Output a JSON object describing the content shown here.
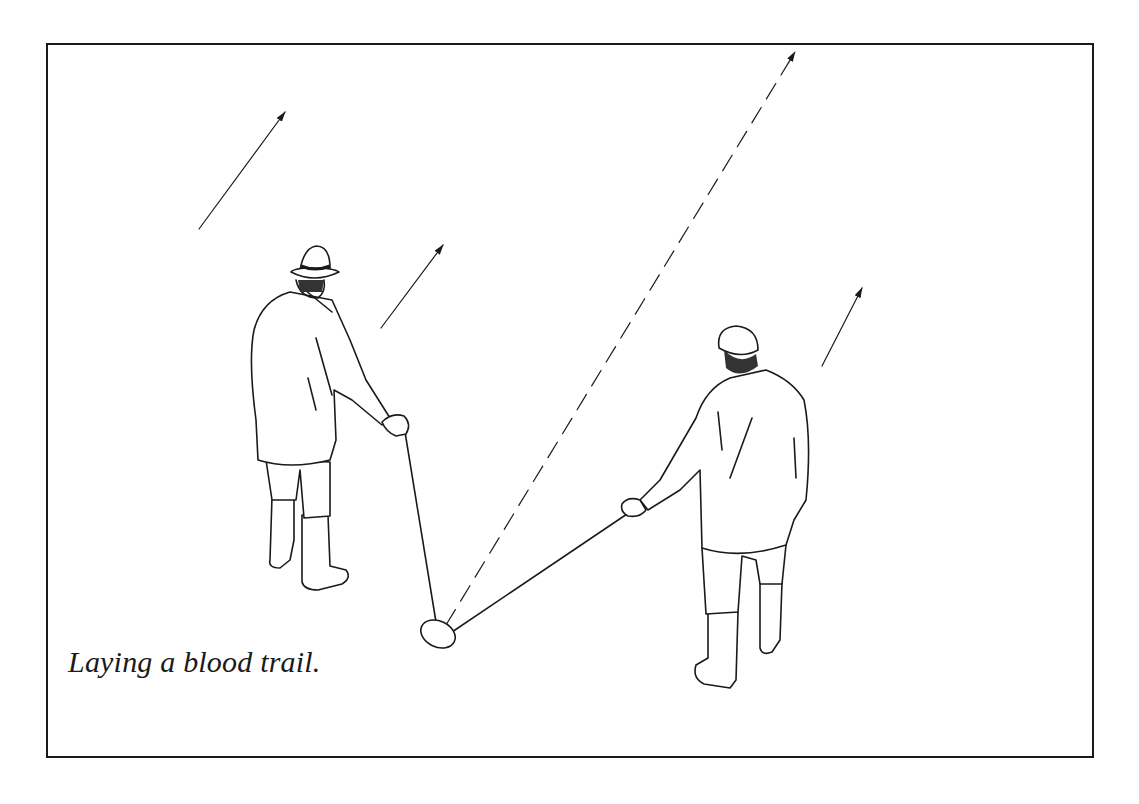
{
  "figure": {
    "caption": "Laying a blood trail.",
    "colors": {
      "ink": "#1a1a1a",
      "background": "#ffffff"
    },
    "elements": [
      "direction-arrow",
      "direction-arrow",
      "direction-arrow",
      "dashed-trail-line",
      "man-with-hat-holding-stick",
      "man-with-cap-holding-stick",
      "scent-pad"
    ]
  }
}
